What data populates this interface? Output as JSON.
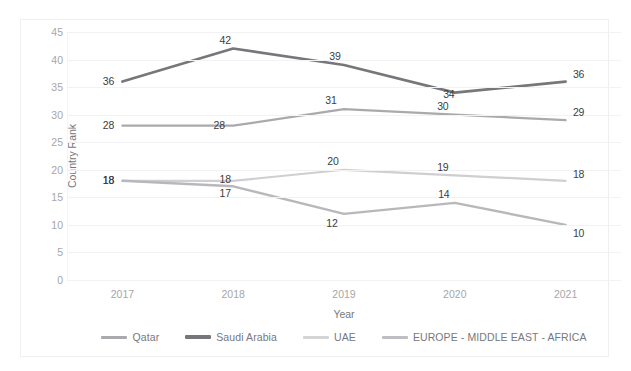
{
  "figure": {
    "clipped_caption": "",
    "background_color": "#ffffff",
    "frame_border_color": "#efeff1"
  },
  "chart_data": {
    "type": "line",
    "title": "",
    "xlabel": "Year",
    "ylabel": "Country Rank",
    "categories": [
      "2017",
      "2018",
      "2019",
      "2020",
      "2021"
    ],
    "x": [
      2017,
      2018,
      2019,
      2020,
      2021
    ],
    "ylim": [
      0,
      45
    ],
    "ytick_step": 5,
    "yticks": [
      45,
      40,
      35,
      30,
      25,
      20,
      15,
      10,
      5,
      0
    ],
    "grid": true,
    "grid_axis": "y",
    "legend_position": "bottom",
    "data_labels": true,
    "markers": false,
    "series": [
      {
        "name": "Qatar",
        "color": "#aaaaae",
        "width": 2.2,
        "values": [
          28,
          28,
          31,
          30,
          29
        ],
        "label_offsets": [
          {
            "dx": -14,
            "dy": -1
          },
          {
            "dx": -14,
            "dy": -1
          },
          {
            "dx": -13,
            "dy": -9
          },
          {
            "dx": -12,
            "dy": -9
          },
          {
            "dx": 13,
            "dy": -8
          }
        ]
      },
      {
        "name": "Saudi Arabia",
        "color": "#77777b",
        "width": 2.6,
        "values": [
          36,
          42,
          39,
          34,
          36
        ],
        "label_offsets": [
          {
            "dx": -14,
            "dy": -1
          },
          {
            "dx": -8,
            "dy": -9
          },
          {
            "dx": -9,
            "dy": -9
          },
          {
            "dx": -6,
            "dy": 1
          },
          {
            "dx": 13,
            "dy": -8
          }
        ]
      },
      {
        "name": "UAE",
        "color": "#cfcfd2",
        "width": 2.2,
        "values": [
          18,
          18,
          20,
          19,
          18
        ],
        "label_offsets": [
          {
            "dx": -14,
            "dy": -1
          },
          {
            "dx": -8,
            "dy": -2
          },
          {
            "dx": -11,
            "dy": -9
          },
          {
            "dx": -12,
            "dy": -8
          },
          {
            "dx": 13,
            "dy": -7
          }
        ]
      },
      {
        "name": "EUROPE - MIDDLE EAST - AFRICA",
        "color": "#b8b8bc",
        "width": 2.4,
        "values": [
          18,
          17,
          12,
          14,
          10
        ],
        "label_offsets": [
          {
            "dx": -14,
            "dy": -1
          },
          {
            "dx": -8,
            "dy": 7
          },
          {
            "dx": -12,
            "dy": 9
          },
          {
            "dx": -11,
            "dy": -9
          },
          {
            "dx": 13,
            "dy": 8
          }
        ]
      }
    ]
  },
  "legend": {
    "items": [
      {
        "label": "Qatar",
        "color": "#aaaaae",
        "thickness": 3
      },
      {
        "label": "Saudi Arabia",
        "color": "#77777b",
        "thickness": 4
      },
      {
        "label": "UAE",
        "color": "#d4d4d7",
        "thickness": 3
      },
      {
        "label": "EUROPE - MIDDLE EAST - AFRICA",
        "color": "#bfbfc3",
        "thickness": 3
      }
    ]
  }
}
